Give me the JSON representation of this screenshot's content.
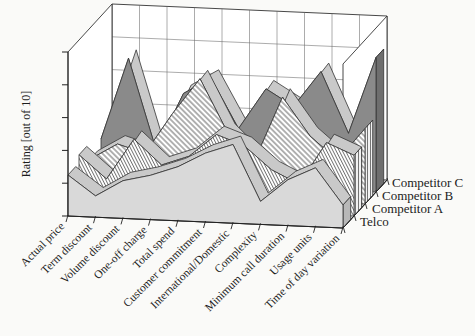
{
  "figure": {
    "background": "#fafaf8",
    "plot_wall_color": "#ffffff",
    "floor_color": "#d5d5d5",
    "edge_color": "#333333",
    "grid_color": "#666666",
    "ribbon_top_color": "#c9c9c9"
  },
  "chart_data": {
    "type": "area",
    "projection": "3d-ribbon",
    "title": "",
    "xlabel": "",
    "ylabel": "Rating [out of 10]",
    "ylim": [
      0,
      10
    ],
    "y_major_unit": 2,
    "grid": true,
    "legend_position": "right",
    "categories": [
      "Actual price",
      "Term discount",
      "Volume discount",
      "One-off charge",
      "Total spend",
      "Customer commitment",
      "International/Domestic",
      "Complexity",
      "Minimum call duration",
      "Usage units",
      "Time of day variation"
    ],
    "series": [
      {
        "name": "Telco",
        "fill_style": "solid-light",
        "color": "#d9d9d9",
        "values": [
          2.5,
          1.3,
          2.3,
          2.7,
          3.3,
          4.2,
          4.8,
          1.4,
          2.8,
          3.6,
          1.4
        ]
      },
      {
        "name": "Competitor A",
        "fill_style": "hatch-fine",
        "color": "#ffffff",
        "values": [
          3.0,
          1.6,
          4.1,
          2.6,
          3.2,
          4.6,
          4.0,
          2.6,
          1.8,
          4.4,
          3.7
        ]
      },
      {
        "name": "Competitor B",
        "fill_style": "hatch-wide",
        "color": "#ffffff",
        "values": [
          2.0,
          3.0,
          2.5,
          5.0,
          7.2,
          4.0,
          2.4,
          6.3,
          4.0,
          2.6,
          4.6
        ]
      },
      {
        "name": "Competitor C",
        "fill_style": "solid-dark",
        "color": "#8a8a8a",
        "values": [
          2.5,
          7.5,
          2.0,
          5.5,
          6.5,
          3.5,
          6.0,
          5.0,
          7.2,
          3.5,
          8.2
        ]
      }
    ]
  }
}
